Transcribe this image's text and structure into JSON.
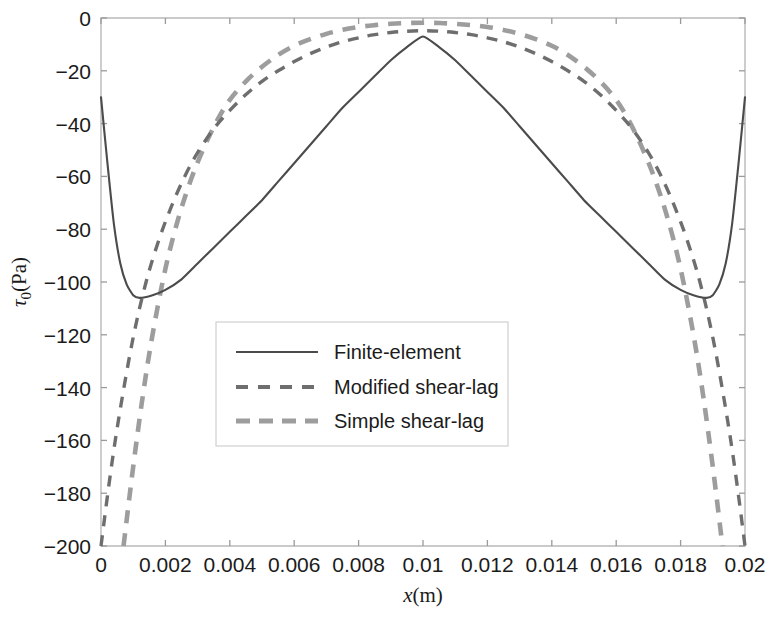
{
  "chart_data": {
    "type": "line",
    "title": "",
    "xlabel": "x(m)",
    "ylabel": "τ₀(Pa)",
    "xlim": [
      0,
      0.02
    ],
    "ylim": [
      -200,
      0
    ],
    "xticks": [
      "0",
      "0.002",
      "0.004",
      "0.006",
      "0.008",
      "0.01",
      "0.012",
      "0.014",
      "0.016",
      "0.018",
      "0.02"
    ],
    "xtick_values": [
      0,
      0.002,
      0.004,
      0.006,
      0.008,
      0.01,
      0.012,
      0.014,
      0.016,
      0.018,
      0.02
    ],
    "yticks": [
      "0",
      "−20",
      "−40",
      "−60",
      "−80",
      "−100",
      "−120",
      "−140",
      "−160",
      "−180",
      "−200"
    ],
    "ytick_values": [
      0,
      -20,
      -40,
      -60,
      -80,
      -100,
      -120,
      -140,
      -160,
      -180,
      -200
    ],
    "grid": false,
    "legend_position": "center-left",
    "series": [
      {
        "name": "Finite-element",
        "style": "solid",
        "color": "#4b4b4b",
        "x": [
          0.0,
          0.0002,
          0.0004,
          0.0006,
          0.0008,
          0.001,
          0.0012,
          0.0016,
          0.002,
          0.0025,
          0.003,
          0.0035,
          0.004,
          0.0045,
          0.005,
          0.0055,
          0.006,
          0.0065,
          0.007,
          0.0075,
          0.008,
          0.0085,
          0.009,
          0.0095,
          0.01,
          0.0105,
          0.011,
          0.0115,
          0.012,
          0.0125,
          0.013,
          0.0135,
          0.014,
          0.0145,
          0.015,
          0.0155,
          0.016,
          0.0165,
          0.017,
          0.0175,
          0.018,
          0.0184,
          0.0188,
          0.019,
          0.0192,
          0.0194,
          0.0196,
          0.0198,
          0.02
        ],
        "y": [
          -30,
          -55,
          -78,
          -93,
          -101,
          -105,
          -106,
          -105,
          -103,
          -99,
          -93,
          -87,
          -81,
          -75,
          -69,
          -62,
          -55,
          -48,
          -41,
          -34,
          -28,
          -22,
          -16,
          -11,
          -7,
          -11,
          -16,
          -22,
          -28,
          -34,
          -41,
          -48,
          -55,
          -62,
          -69,
          -75,
          -81,
          -87,
          -93,
          -99,
          -103,
          -105,
          -106,
          -105,
          -101,
          -93,
          -78,
          -55,
          -30
        ]
      },
      {
        "name": "Modified shear-lag",
        "style": "dashed",
        "color": "#6e6e6e",
        "x": [
          0.0,
          0.0003,
          0.0006,
          0.001,
          0.0014,
          0.0018,
          0.0022,
          0.0026,
          0.003,
          0.0035,
          0.004,
          0.0045,
          0.005,
          0.0055,
          0.006,
          0.0065,
          0.007,
          0.0075,
          0.008,
          0.0085,
          0.009,
          0.0095,
          0.01,
          0.0105,
          0.011,
          0.0115,
          0.012,
          0.0125,
          0.013,
          0.0135,
          0.014,
          0.0145,
          0.015,
          0.0155,
          0.016,
          0.0165,
          0.017,
          0.0174,
          0.0178,
          0.0182,
          0.0186,
          0.019,
          0.0194,
          0.0197,
          0.02
        ],
        "y": [
          -200,
          -172,
          -148,
          -121,
          -100,
          -84,
          -71,
          -60,
          -51,
          -42,
          -35,
          -29,
          -24,
          -20,
          -16.5,
          -13.5,
          -11,
          -9,
          -7.5,
          -6.3,
          -5.5,
          -5.0,
          -4.8,
          -5.0,
          -5.5,
          -6.3,
          -7.5,
          -9,
          -11,
          -13.5,
          -16.5,
          -20,
          -24,
          -29,
          -35,
          -42,
          -51,
          -60,
          -71,
          -84,
          -100,
          -121,
          -148,
          -172,
          -200
        ]
      },
      {
        "name": "Simple shear-lag",
        "style": "dashdot",
        "color": "#9d9d9d",
        "x": [
          0.0007,
          0.001,
          0.0013,
          0.0016,
          0.002,
          0.0024,
          0.0028,
          0.0032,
          0.0036,
          0.004,
          0.0045,
          0.005,
          0.0055,
          0.006,
          0.0065,
          0.007,
          0.0075,
          0.008,
          0.0085,
          0.009,
          0.0095,
          0.01,
          0.0105,
          0.011,
          0.0115,
          0.012,
          0.0125,
          0.013,
          0.0135,
          0.014,
          0.0145,
          0.015,
          0.0155,
          0.016,
          0.0164,
          0.0168,
          0.0172,
          0.0176,
          0.018,
          0.0184,
          0.0187,
          0.019,
          0.0193
        ],
        "y": [
          -200,
          -170,
          -143,
          -120,
          -95,
          -76,
          -61,
          -49,
          -39,
          -31,
          -24,
          -18.5,
          -14,
          -10.5,
          -8,
          -6,
          -4.5,
          -3.4,
          -2.7,
          -2.2,
          -1.9,
          -1.8,
          -1.9,
          -2.2,
          -2.7,
          -3.4,
          -4.5,
          -6,
          -8,
          -10.5,
          -14,
          -18.5,
          -24,
          -31,
          -39,
          -49,
          -61,
          -76,
          -95,
          -120,
          -143,
          -170,
          -200
        ]
      }
    ]
  },
  "legend": {
    "items": [
      {
        "label": "Finite-element"
      },
      {
        "label": "Modified shear-lag"
      },
      {
        "label": "Simple shear-lag"
      }
    ]
  }
}
